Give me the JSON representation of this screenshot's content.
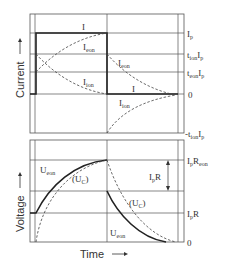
{
  "top_panel": {
    "axis_title": "Current",
    "right_labels": [
      {
        "main": "I",
        "sub": "p",
        "rest": ""
      },
      {
        "main": "t",
        "sub": "ion",
        "rest": "I",
        "sub2": "p"
      },
      {
        "main": "t",
        "sub": "eon",
        "rest": "I",
        "sub2": "p"
      },
      {
        "main": "0"
      },
      {
        "main": "-t",
        "sub": "ion",
        "rest": "I",
        "sub2": "p"
      }
    ],
    "curve_labels": {
      "I_top": "I",
      "Ieon_1": "I",
      "Ieon_1_sub": "eon",
      "Iion_1": "I",
      "Iion_1_sub": "ion",
      "Ieon_2": "I",
      "Ieon_2_sub": "eon",
      "I_bottom": "I",
      "Iion_2": "I",
      "Iion_2_sub": "ion"
    }
  },
  "bottom_panel": {
    "axis_title": "Voltage",
    "x_axis_title": "Time",
    "right_labels": [
      {
        "main": "I",
        "sub": "p",
        "rest": "R",
        "sub2": "eon"
      },
      {
        "main": "I",
        "sub": "p",
        "rest": "R"
      },
      {
        "main": "0"
      }
    ],
    "curve_labels": {
      "Ueon_1": "U",
      "Ueon_1_sub": "eon",
      "Uc_1": "(U",
      "Uc_1_sub": "C",
      "Uc_1_close": ")",
      "IpR_main": "I",
      "IpR_sub": "p",
      "IpR_rest": "R",
      "Uc_2": "(U",
      "Uc_2_sub": "C",
      "Uc_2_close": ")",
      "Ueon_2": "U",
      "Ueon_2_sub": "eon"
    }
  },
  "colors": {
    "line": "#222222",
    "grid": "#555555",
    "dashed": "#444444"
  }
}
